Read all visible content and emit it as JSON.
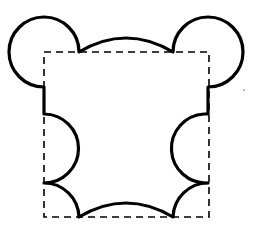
{
  "diagram": {
    "colors": {
      "background": "#ffffff",
      "outline": "#000000",
      "dashed_square": "#000000",
      "noise_dot": "#9a9a9a"
    },
    "square": {
      "x": 44,
      "y": 52,
      "width": 165,
      "height": 165,
      "style": "dashed"
    },
    "shape_paths": {
      "outline": "M 79 52 Q 126 24 173 52 A 35 35 0 1 1 208 87 L 208 114 L 204 114 A 34 34 0 0 0 208 183 A 35 35 0 0 0 173 217 Q 126 189 79 217 A 35 35 0 0 0 44 183 A 34 34 0 0 0 44 114 L 44 87 A 35 35 0 1 1 79 52 Z"
    },
    "noise_dot": {
      "x": 244,
      "y": 90
    }
  }
}
